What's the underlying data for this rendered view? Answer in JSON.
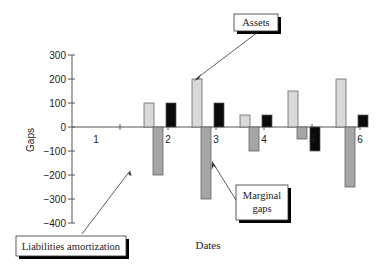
{
  "chart_data": {
    "type": "bar",
    "title": "",
    "xlabel": "Dates",
    "ylabel": "Gaps",
    "ylim": [
      -400,
      300
    ],
    "yticks": [
      300,
      200,
      100,
      0,
      -100,
      -200,
      -300,
      -400
    ],
    "ytick_labels": [
      "300",
      "200",
      "100",
      "0",
      "−100",
      "−200",
      "−300",
      "−400"
    ],
    "categories": [
      "1",
      "2",
      "3",
      "4",
      "5",
      "6"
    ],
    "series": [
      {
        "name": "Assets",
        "color": "#d9d9d9",
        "values": [
          0,
          100,
          200,
          50,
          150,
          200
        ]
      },
      {
        "name": "Liabilities amortization",
        "color": "#a6a6a6",
        "values": [
          0,
          -200,
          -300,
          -100,
          -50,
          -250
        ]
      },
      {
        "name": "Marginal gaps",
        "color": "#0a0a0a",
        "values": [
          0,
          100,
          100,
          50,
          -100,
          50
        ]
      }
    ],
    "grid": false,
    "legend": "none",
    "annotations": [
      {
        "text": [
          "Assets"
        ],
        "points_to": "Assets bar at date 3"
      },
      {
        "text": [
          "Marginal",
          "gaps"
        ],
        "points_to": "region below date 3"
      },
      {
        "text": [
          "Liabilities amortization"
        ],
        "points_to": "Liabilities bar at date 2"
      }
    ]
  }
}
